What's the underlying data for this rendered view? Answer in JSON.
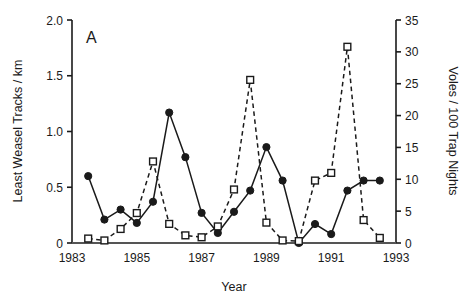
{
  "figure": {
    "panel_label": "A",
    "background_color": "#ffffff",
    "line_color": "#1a1a1a"
  },
  "chart_data": {
    "type": "line",
    "title": "",
    "subtitle": "",
    "xlabel": "Year",
    "ylabel": "Least Weasel Tracks / km",
    "y2label": "Voles / 100 Trap Nights",
    "xlim": [
      1983,
      1993
    ],
    "ylim": [
      0,
      2.0
    ],
    "y2lim": [
      0,
      35
    ],
    "grid": false,
    "legend_position": "none",
    "x_ticks": [
      1983,
      1985,
      1987,
      1989,
      1991,
      1993
    ],
    "x_tick_labels": [
      "1983",
      "1985",
      "1987",
      "1989",
      "1991",
      "1993"
    ],
    "y_ticks": [
      0,
      0.5,
      1.0,
      1.5,
      2.0
    ],
    "y_tick_labels": [
      "0",
      "0.5",
      "1.0",
      "1.5",
      "2.0"
    ],
    "y2_ticks": [
      0,
      5,
      10,
      15,
      20,
      25,
      30,
      35
    ],
    "y2_tick_labels": [
      "0",
      "5",
      "10",
      "15",
      "20",
      "25",
      "30",
      "35"
    ],
    "series": [
      {
        "name": "Least Weasel Tracks / km",
        "axis": "left",
        "marker": "filled-circle",
        "linestyle": "solid",
        "color": "#1a1a1a",
        "x": [
          1983.5,
          1984.0,
          1984.5,
          1985.0,
          1985.5,
          1986.0,
          1986.5,
          1987.0,
          1987.5,
          1988.0,
          1988.5,
          1989.0,
          1989.5,
          1990.0,
          1990.5,
          1991.0,
          1991.5,
          1992.0,
          1992.5
        ],
        "y": [
          0.6,
          0.21,
          0.3,
          0.18,
          0.37,
          1.17,
          0.77,
          0.27,
          0.09,
          0.28,
          0.47,
          0.86,
          0.56,
          0.0,
          0.17,
          0.08,
          0.47,
          0.56,
          0.56
        ]
      },
      {
        "name": "Voles / 100 Trap Nights",
        "axis": "right",
        "marker": "open-square",
        "linestyle": "dashed",
        "color": "#1a1a1a",
        "x": [
          1983.5,
          1984.0,
          1984.5,
          1985.0,
          1985.5,
          1986.0,
          1986.5,
          1987.0,
          1987.5,
          1988.0,
          1988.5,
          1989.0,
          1989.5,
          1990.0,
          1990.5,
          1991.0,
          1991.5,
          1992.0,
          1992.5
        ],
        "y": [
          0.7,
          0.4,
          2.2,
          4.7,
          12.8,
          3.0,
          1.2,
          0.9,
          2.6,
          8.4,
          25.6,
          3.2,
          0.4,
          0.3,
          9.8,
          11.0,
          30.8,
          3.6,
          0.8
        ]
      }
    ]
  }
}
